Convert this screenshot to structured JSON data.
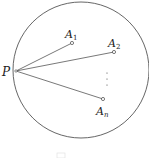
{
  "diagram": {
    "circle": {
      "cx": 81,
      "cy": 70,
      "r": 68,
      "stroke": "#555555"
    },
    "point_P": {
      "label": "P",
      "x": 16,
      "y": 71
    },
    "points": [
      {
        "label": "A",
        "sub": "1",
        "x": 72,
        "y": 43
      },
      {
        "label": "A",
        "sub": "2",
        "x": 114,
        "y": 52
      },
      {
        "label": "A",
        "sub": "n",
        "x": 103,
        "y": 99
      }
    ],
    "ellipsis": "⋮",
    "caption_fragment": ""
  }
}
